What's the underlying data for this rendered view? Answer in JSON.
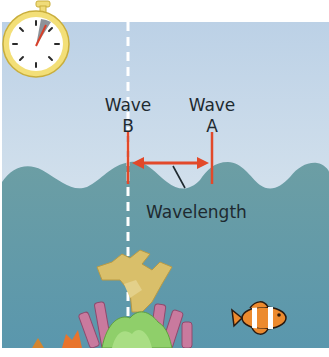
{
  "diagram": {
    "labels": {
      "wave_b": {
        "line1": "Wave",
        "line2": "B"
      },
      "wave_a": {
        "line1": "Wave",
        "line2": "A"
      },
      "wavelength": "Wavelength"
    },
    "icons": [
      "stopwatch-icon",
      "coral-icon",
      "clownfish-icon"
    ],
    "colors": {
      "sky": "#c4d6e6",
      "water": "#5c9aa6",
      "marker": "#e2492a",
      "stopwatch_rim": "#e9d46a",
      "text": "#1e2a30"
    }
  }
}
